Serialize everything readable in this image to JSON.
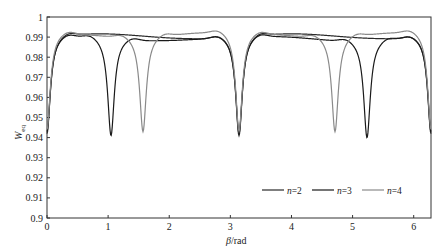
{
  "chart_data": {
    "type": "line",
    "title": "",
    "xlabel": "β/rad",
    "xlabel_italic": "β",
    "xlabel_unit": "/rad",
    "ylabel": "W_eq",
    "ylabel_main": "W",
    "ylabel_sub": "eq",
    "xlim": [
      0,
      6.283
    ],
    "ylim": [
      0.9,
      1.0
    ],
    "xticks": [
      0,
      1,
      2,
      3,
      4,
      5,
      6
    ],
    "xtick_labels": [
      "0",
      "1",
      "2",
      "3",
      "4",
      "5",
      "6"
    ],
    "yticks": [
      0.9,
      0.91,
      0.92,
      0.93,
      0.94,
      0.95,
      0.96,
      0.97,
      0.98,
      0.99,
      1.0
    ],
    "ytick_labels": [
      "0.9",
      "0.91",
      "0.92",
      "0.93",
      "0.94",
      "0.95",
      "0.96",
      "0.97",
      "0.98",
      "0.99",
      "1"
    ],
    "grid": false,
    "legend_position": "lower right",
    "series": [
      {
        "name": "n=2",
        "label_n": "n",
        "label_val": "=2",
        "color": "#2a2a2a",
        "baseline": 0.9905,
        "dips": [
          {
            "beta": 0.0,
            "min": 0.942
          },
          {
            "beta": 3.1416,
            "min": 0.941
          },
          {
            "beta": 6.2832,
            "min": 0.942
          }
        ]
      },
      {
        "name": "n=3",
        "label_n": "n",
        "label_val": "=3",
        "color": "#1a1a1a",
        "baseline": 0.9895,
        "dips": [
          {
            "beta": 0.0,
            "min": 0.942
          },
          {
            "beta": 1.0472,
            "min": 0.941
          },
          {
            "beta": 3.1416,
            "min": 0.941
          },
          {
            "beta": 5.236,
            "min": 0.941
          },
          {
            "beta": 6.2832,
            "min": 0.942
          }
        ]
      },
      {
        "name": "n=4",
        "label_n": "n",
        "label_val": "=4",
        "color": "#8a8a8a",
        "baseline": 0.9915,
        "dips": [
          {
            "beta": 0.0,
            "min": 0.943
          },
          {
            "beta": 1.5708,
            "min": 0.944
          },
          {
            "beta": 3.1416,
            "min": 0.942
          },
          {
            "beta": 4.7124,
            "min": 0.944
          },
          {
            "beta": 6.2832,
            "min": 0.943
          }
        ]
      }
    ]
  }
}
